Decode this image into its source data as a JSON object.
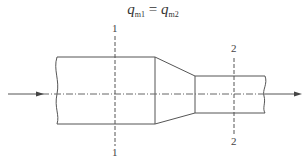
{
  "equation": {
    "lhs_var": "q",
    "lhs_sub": "m1",
    "operator": "=",
    "rhs_var": "q",
    "rhs_sub": "m2"
  },
  "sections": [
    {
      "id": "1",
      "top_label": "1",
      "bottom_label": "1"
    },
    {
      "id": "2",
      "top_label": "2",
      "bottom_label": "2"
    }
  ],
  "colors": {
    "line": "#555555",
    "text": "#333333"
  }
}
